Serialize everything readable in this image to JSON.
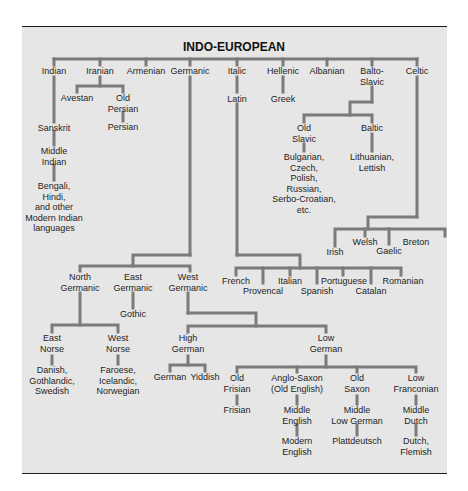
{
  "title": "INDO-EUROPEAN",
  "colors": {
    "panel_background": "#e6e6e6",
    "line": "#7b7b7b",
    "text": "#1e1e1e",
    "frame": "#1a1a1a"
  },
  "branches": {
    "indian": "Indian",
    "iranian": "Iranian",
    "armenian": "Armenian",
    "germanic": "Germanic",
    "italic": "Italic",
    "hellenic": "Hellenic",
    "albanian": "Albanian",
    "balto_slavic": "Balto-\nSlavic",
    "celtic": "Celtic"
  },
  "indian": {
    "sanskrit": "Sanskrit",
    "middle_indian": "Middle\nIndian",
    "modern": "Bengali,\nHindi,\nand other\nModern Indian\nlanguages"
  },
  "iranian": {
    "avestan": "Avestan",
    "old_persian": "Old\nPersian",
    "persian": "Persian"
  },
  "italic": {
    "latin": "Latin",
    "french": "French",
    "provencal": "Provencal",
    "italian": "Italian",
    "spanish": "Spanish",
    "portuguese": "Portuguese",
    "catalan": "Catalan",
    "romanian": "Romanian"
  },
  "hellenic": {
    "greek": "Greek"
  },
  "balto_slavic": {
    "old_slavic": "Old\nSlavic",
    "slavic_langs": "Bulgarian,\nCzech,\nPolish,\nRussian,\nSerbo-Croatian,\netc.",
    "baltic": "Baltic",
    "baltic_langs": "Lithuanian,\nLettish"
  },
  "celtic": {
    "irish": "Irish",
    "welsh": "Welsh",
    "gaelic": "Gaelic",
    "breton": "Breton"
  },
  "germanic": {
    "north": "North\nGermanic",
    "east": "East\nGermanic",
    "west": "West\nGermanic",
    "gothic": "Gothic",
    "east_norse": "East\nNorse",
    "west_norse": "West\nNorse",
    "east_norse_langs": "Danish,\nGothlandic,\nSwedish",
    "west_norse_langs": "Faroese,\nIcelandic,\nNorwegian",
    "high_german": "High\nGerman",
    "low_german": "Low\nGerman",
    "german": "German",
    "yiddish": "Yiddish",
    "old_frisian": "Old\nFrisian",
    "frisian": "Frisian",
    "anglo_saxon": "Anglo-Saxon\n(Old English)",
    "middle_english": "Middle\nEnglish",
    "modern_english": "Modern\nEnglish",
    "old_saxon": "Old\nSaxon",
    "middle_low_german": "Middle\nLow German",
    "plattdeutsch": "Plattdeutsch",
    "low_franconian": "Low\nFranconian",
    "middle_dutch": "Middle\nDutch",
    "dutch_flemish": "Dutch,\nFlemish"
  }
}
